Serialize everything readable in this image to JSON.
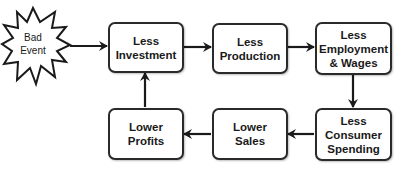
{
  "diagram": {
    "type": "flowchart-cycle",
    "start": {
      "id": "bad-event",
      "lines": [
        "Bad",
        "Event"
      ],
      "shape": "starburst"
    },
    "nodes": [
      {
        "id": "less-investment",
        "lines": [
          "Less",
          "Investment"
        ]
      },
      {
        "id": "less-production",
        "lines": [
          "Less",
          "Production"
        ]
      },
      {
        "id": "less-employment",
        "lines": [
          "Less",
          "Employment",
          "& Wages"
        ]
      },
      {
        "id": "less-consumer-spending",
        "lines": [
          "Less",
          "Consumer",
          "Spending"
        ]
      },
      {
        "id": "lower-sales",
        "lines": [
          "Lower",
          "Sales"
        ]
      },
      {
        "id": "lower-profits",
        "lines": [
          "Lower",
          "Profits"
        ]
      }
    ],
    "edges": [
      [
        "bad-event",
        "less-investment"
      ],
      [
        "less-investment",
        "less-production"
      ],
      [
        "less-production",
        "less-employment"
      ],
      [
        "less-employment",
        "less-consumer-spending"
      ],
      [
        "less-consumer-spending",
        "lower-sales"
      ],
      [
        "lower-sales",
        "lower-profits"
      ],
      [
        "lower-profits",
        "less-investment"
      ]
    ],
    "colors": {
      "stroke": "#2a2a2a",
      "text": "#1a1a1a",
      "fill": "#ffffff"
    }
  }
}
